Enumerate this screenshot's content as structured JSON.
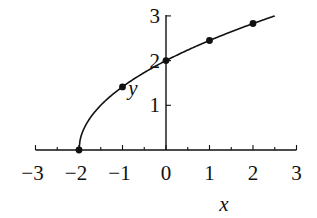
{
  "chart_data": {
    "type": "line",
    "title": "",
    "function": "y = sqrt(2x + 4)",
    "xlabel": "x",
    "ylabel": "y",
    "xlim": [
      -3,
      3
    ],
    "ylim": [
      0,
      3
    ],
    "xticks": [
      -3,
      -2,
      -1,
      0,
      1,
      2,
      3
    ],
    "xtick_labels": [
      "−3",
      "−2",
      "−1",
      "0",
      "1",
      "2",
      "3"
    ],
    "xminor_step": 0.5,
    "yticks": [
      1,
      2,
      3
    ],
    "ytick_labels": [
      "1",
      "2",
      "3"
    ],
    "grid": false,
    "legend": null,
    "curve_domain": [
      -2,
      2.5
    ],
    "points": [
      {
        "x": -2,
        "y": 0
      },
      {
        "x": -1,
        "y": 1.41
      },
      {
        "x": 0,
        "y": 2
      },
      {
        "x": 1,
        "y": 2.45
      },
      {
        "x": 2,
        "y": 2.83
      }
    ],
    "colors": {
      "line": "#111111",
      "point": "#111111",
      "axis": "#111111"
    }
  }
}
